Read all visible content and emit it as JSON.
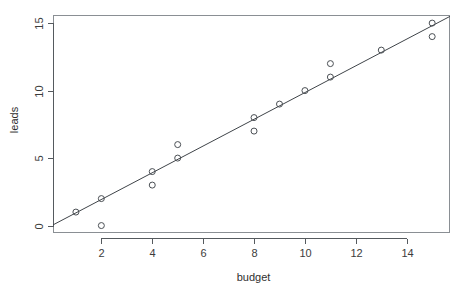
{
  "page": {
    "faint_header_text": "",
    "faint_corner_text": ""
  },
  "chart_data": {
    "type": "scatter",
    "title": "",
    "xlabel": "budget",
    "ylabel": "leads",
    "xlim": [
      0.1,
      15.7
    ],
    "ylim": [
      -0.55,
      15.6
    ],
    "grid": false,
    "legend": null,
    "x_ticks": [
      2,
      4,
      6,
      8,
      10,
      12,
      14
    ],
    "x_tick_labels": [
      "2",
      "4",
      "6",
      "8",
      "10",
      "12",
      "14"
    ],
    "y_ticks": [
      0,
      5,
      10,
      15
    ],
    "y_tick_labels": [
      "0",
      "5",
      "10",
      "15"
    ],
    "points": [
      {
        "x": 1,
        "y": 1
      },
      {
        "x": 2,
        "y": 2
      },
      {
        "x": 2,
        "y": 0
      },
      {
        "x": 4,
        "y": 4
      },
      {
        "x": 4,
        "y": 3
      },
      {
        "x": 5,
        "y": 5
      },
      {
        "x": 5,
        "y": 6
      },
      {
        "x": 8,
        "y": 8
      },
      {
        "x": 8,
        "y": 7
      },
      {
        "x": 9,
        "y": 9
      },
      {
        "x": 10,
        "y": 10
      },
      {
        "x": 11,
        "y": 11
      },
      {
        "x": 11,
        "y": 12
      },
      {
        "x": 13,
        "y": 13
      },
      {
        "x": 15,
        "y": 15
      },
      {
        "x": 15,
        "y": 14
      }
    ],
    "marker": "open-circle",
    "marker_radius": 3,
    "fit_line": {
      "type": "linear-regression",
      "x_start": 0.1,
      "y_start": 0.05,
      "x_end": 15.7,
      "y_end": 15.5
    },
    "colors": {
      "point_stroke": "#4a4f54",
      "line": "#3f4449",
      "axis": "#555a5e",
      "box": "#8a8f94",
      "text": "#3c3c3c",
      "background": "#ffffff"
    }
  }
}
